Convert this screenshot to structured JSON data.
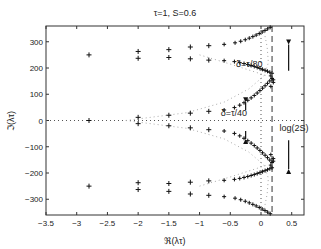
{
  "chart_data": {
    "type": "scatter",
    "title": "τ=1, S=0.6",
    "xlabel": "ℜ(λτ)",
    "ylabel": "ℑ(λτ)",
    "xlim": [
      -3.5,
      0.7
    ],
    "ylim": [
      -360,
      360
    ],
    "xticks": [
      -3.5,
      -3,
      -2.5,
      -2,
      -1.5,
      -1,
      -0.5,
      0,
      0.5
    ],
    "xtick_labels": [
      "-3.5",
      "-3",
      "-2.5",
      "-2",
      "-1.5",
      "-1",
      "-0.5",
      "0",
      "0.5"
    ],
    "yticks": [
      -300,
      -200,
      -100,
      0,
      100,
      200,
      300
    ],
    "ytick_labels": [
      "-300",
      "-200",
      "-100",
      "0",
      "100",
      "200",
      "300"
    ],
    "grid": false,
    "annotations": [
      {
        "text": "δ=τ/80",
        "x": 0.05,
        "y": 215
      },
      {
        "text": "δ=τ/40",
        "x": -0.2,
        "y": 30
      },
      {
        "text": "log(2S)",
        "x": 0.3,
        "y": -30
      }
    ],
    "reference_lines": [
      {
        "type": "vertical-dotted",
        "x": 0.0
      },
      {
        "type": "vertical-dashed",
        "x": 0.18,
        "label": "log(2S)"
      },
      {
        "type": "horizontal-dotted",
        "y": 0
      }
    ],
    "series": [
      {
        "name": "eigenvalues (+)",
        "marker": "+",
        "points": [
          [
            -2.8,
            250
          ],
          [
            -2.8,
            0
          ],
          [
            -2.8,
            -250
          ],
          [
            -2.0,
            263
          ],
          [
            -2.0,
            237
          ],
          [
            -2.0,
            12
          ],
          [
            -2.0,
            -12
          ],
          [
            -2.0,
            -237
          ],
          [
            -2.0,
            -263
          ],
          [
            -1.5,
            270
          ],
          [
            -1.5,
            240
          ],
          [
            -1.5,
            20
          ],
          [
            -1.5,
            -20
          ],
          [
            -1.5,
            -240
          ],
          [
            -1.5,
            -270
          ],
          [
            -1.15,
            280
          ],
          [
            -1.15,
            235
          ],
          [
            -1.15,
            28
          ],
          [
            -1.15,
            -28
          ],
          [
            -1.15,
            -235
          ],
          [
            -1.15,
            -280
          ],
          [
            -0.85,
            285
          ],
          [
            -0.85,
            230
          ],
          [
            -0.85,
            35
          ],
          [
            -0.85,
            -35
          ],
          [
            -0.85,
            -230
          ],
          [
            -0.85,
            -285
          ]
        ]
      },
      {
        "name": "branch curves (dotted)",
        "marker": "dotted"
      }
    ]
  }
}
